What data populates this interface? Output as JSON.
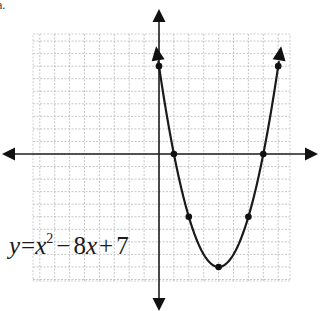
{
  "corner_fragment": "a.",
  "equation": {
    "lhs": "y",
    "eq": "=",
    "x": "x",
    "exp": "2",
    "minus": "−",
    "b": "8",
    "x2": "x",
    "plus": "+",
    "c": "7"
  },
  "chart_data": {
    "type": "line",
    "xlabel": "x",
    "ylabel": "y",
    "function": "y = x^2 - 8x + 7",
    "x_range": [
      -10,
      8.5
    ],
    "y_range": [
      -11,
      9
    ],
    "grid": true,
    "highlighted_points": [
      {
        "x": 0,
        "y": 7
      },
      {
        "x": 1,
        "y": 0
      },
      {
        "x": 2,
        "y": -5
      },
      {
        "x": 4,
        "y": -9
      },
      {
        "x": 6,
        "y": -5
      },
      {
        "x": 7,
        "y": 0
      },
      {
        "x": 8,
        "y": 7
      }
    ],
    "vertex": {
      "x": 4,
      "y": -9
    },
    "roots": [
      1,
      7
    ],
    "y_intercept": 7,
    "curve_endpoints_arrows": true
  },
  "layout": {
    "origin_px": [
      159,
      154
    ],
    "unit_x_px": 14.9,
    "unit_y_px": 12.55,
    "grid_px": {
      "left": 33,
      "top": 34,
      "right": 290,
      "bottom": 281
    }
  }
}
